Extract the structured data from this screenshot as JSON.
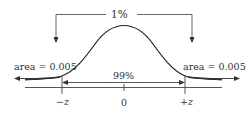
{
  "figure": {
    "type": "normal-distribution-diagram",
    "top_bracket_label": "1%",
    "center_label": "99%",
    "left_tail_label": "area = 0.005",
    "right_tail_label": "area = 0.005",
    "ticks": [
      {
        "label": "−z",
        "x": -1
      },
      {
        "label": "0",
        "x": 0
      },
      {
        "label": "+z",
        "x": 1
      }
    ],
    "colors": {
      "line": "#333333",
      "background": "#ffffff"
    }
  }
}
